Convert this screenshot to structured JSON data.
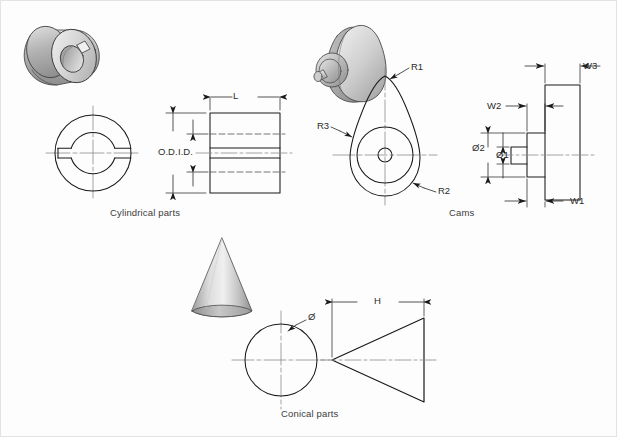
{
  "figure": {
    "background_color": "#fdfdfd",
    "line_color": "#1a1a1a",
    "centerline_color": "#8a8a8a",
    "hidden_line_color": "#5d5d5d",
    "shade_light": "#e8e8e8",
    "shade_mid": "#bcbcbc",
    "shade_dark": "#8f8f8f"
  },
  "groups": [
    {
      "id": "cylindrical",
      "caption": "Cylindrical parts",
      "dimensions": [
        "L",
        "O.D.",
        "I.D."
      ]
    },
    {
      "id": "cams",
      "caption": "Cams",
      "dimensions": [
        "R1",
        "R2",
        "R3",
        "W1",
        "W2",
        "W3",
        "Ø1",
        "Ø2"
      ]
    },
    {
      "id": "conical",
      "caption": "Conical parts",
      "dimensions": [
        "Ø",
        "H"
      ]
    }
  ],
  "labels": {
    "cylindrical": {
      "caption": "Cylindrical parts",
      "length": "L",
      "outer_diameter": "O.D.",
      "inner_diameter": "I.D."
    },
    "cams": {
      "caption": "Cams",
      "r1": "R1",
      "r2": "R2",
      "r3": "R3",
      "w1": "W1",
      "w2": "W2",
      "w3": "W3",
      "d1": "Ø1",
      "d2": "Ø2"
    },
    "conical": {
      "caption": "Conical parts",
      "diameter": "Ø",
      "height": "H"
    }
  }
}
